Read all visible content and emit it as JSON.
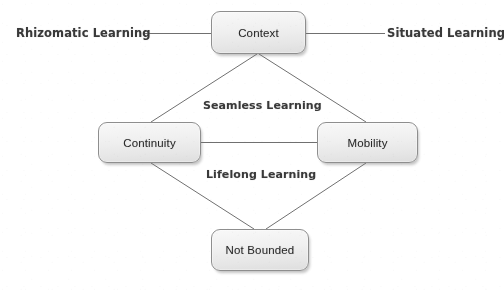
{
  "diagram": {
    "type": "concept-diagram",
    "nodes": [
      {
        "id": "context",
        "label": "Context"
      },
      {
        "id": "continuity",
        "label": "Continuity"
      },
      {
        "id": "mobility",
        "label": "Mobility"
      },
      {
        "id": "not_bounded",
        "label": "Not Bounded"
      }
    ],
    "edge_labels": [
      {
        "id": "rhizomatic",
        "label": "Rhizomatic Learning",
        "position": "left-of-context"
      },
      {
        "id": "situated",
        "label": "Situated Learning",
        "position": "right-of-context"
      },
      {
        "id": "seamless",
        "label": "Seamless Learning",
        "position": "upper-middle"
      },
      {
        "id": "lifelong",
        "label": "Lifelong Learning",
        "position": "lower-middle"
      }
    ],
    "connections": [
      {
        "from": "rhizomatic-label",
        "to": "context",
        "style": "straight-horizontal"
      },
      {
        "from": "context",
        "to": "situated-label",
        "style": "straight-horizontal"
      },
      {
        "from": "context",
        "to": "continuity",
        "style": "straight-diagonal"
      },
      {
        "from": "context",
        "to": "mobility",
        "style": "straight-diagonal"
      },
      {
        "from": "continuity",
        "to": "mobility",
        "style": "straight-horizontal"
      },
      {
        "from": "continuity",
        "to": "not_bounded",
        "style": "straight-diagonal"
      },
      {
        "from": "mobility",
        "to": "not_bounded",
        "style": "straight-diagonal"
      }
    ],
    "colors": {
      "box_fill_top": "#f6f6f6",
      "box_fill_bottom": "#dcdcdc",
      "box_border": "#8e8e8e",
      "line": "#707070",
      "text": "#2b2b2b",
      "label_text": "#3a3a3a",
      "background": "#fefefe"
    }
  }
}
